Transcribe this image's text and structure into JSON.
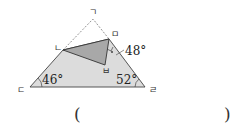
{
  "figure": {
    "vertices": {
      "top": "ㄱ",
      "left_mid": "ㄴ",
      "bottom_left": "ㄷ",
      "bottom_right": "ㄹ",
      "right_mid": "ㅁ",
      "folded": "ㅂ"
    },
    "angles": {
      "bottom_left": "46°",
      "bottom_right": "52°",
      "at_m": "48°"
    },
    "colors": {
      "light_fill": "#d9d9d9",
      "dark_fill": "#a6a6a6",
      "line": "#444444"
    }
  },
  "answer": {
    "open": "(",
    "close": ")"
  }
}
